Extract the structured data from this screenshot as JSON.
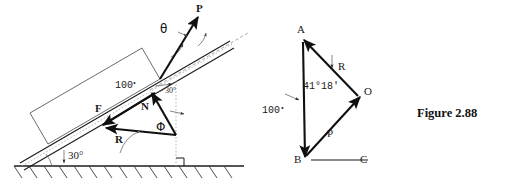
{
  "figure": {
    "caption": "Figure 2.88",
    "background_color": "#ffffff",
    "ink_color": "#1a1a1a"
  },
  "left_diagram": {
    "name": "block-on-incline-free-body-diagram",
    "incline_angle_label": "30°",
    "surface_angle_label": "30°",
    "weight_label": "100",
    "weight_unit_mark": "•",
    "applied_force_label": "P",
    "applied_force_angle_label": "θ",
    "friction_label": "F",
    "normal_label": "N",
    "resultant_label": "R",
    "resultant_angle_label": "Φ",
    "ground_hatch_count": 15,
    "right_angle_marker": true
  },
  "right_diagram": {
    "name": "force-triangle-diagram",
    "vertices": [
      {
        "label": "A",
        "x": 303,
        "y": 37
      },
      {
        "label": "O",
        "x": 360,
        "y": 97
      },
      {
        "label": "B",
        "x": 305,
        "y": 155
      },
      {
        "label": "C",
        "x": 355,
        "y": 157
      }
    ],
    "angle_label": "41°18'",
    "side_weight_label": "100",
    "side_weight_unit_mark": "•",
    "side_resultant_label": "R",
    "side_applied_label": "P",
    "baseline": true
  }
}
